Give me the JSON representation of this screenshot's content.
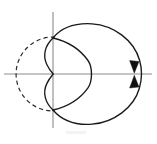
{
  "figure": {
    "background_color": "#ffffff",
    "width": 157,
    "height": 144,
    "origin": {
      "x": 53,
      "y": 74
    },
    "axes": {
      "axis_color": "#8c8c8c",
      "x_axis": {
        "name": "x-axis",
        "x1": 4,
        "y1": 74,
        "x2": 152,
        "y2": 74
      },
      "y_axis": {
        "name": "y-axis",
        "x1": 53,
        "y1": 12,
        "x2": 53,
        "y2": 128
      }
    },
    "curves": [
      {
        "name": "dashed-generating-circle",
        "style": "dashed",
        "color": "#2b2b2b",
        "center": {
          "x": 53,
          "y": 74
        },
        "radius": 37,
        "note": "dashed circle centered at origin, left arc visible"
      },
      {
        "name": "limacon-outer-loop",
        "style": "solid",
        "color": "#1a1a1a",
        "center": {
          "x": 90,
          "y": 74
        },
        "radius": 51,
        "note": "large solid circle passing near origin cusp"
      },
      {
        "name": "limacon-inner-loop",
        "style": "solid",
        "color": "#1a1a1a",
        "center": {
          "x": 72,
          "y": 74
        },
        "radius": 20,
        "note": "small inner loop through the origin forming a cusp"
      }
    ],
    "arrows": [
      {
        "name": "direction-arrow-upper",
        "x": 134,
        "y": 68,
        "direction": "down",
        "color": "#111111"
      },
      {
        "name": "direction-arrow-lower",
        "x": 134,
        "y": 80,
        "direction": "up",
        "color": "#111111"
      }
    ],
    "intersection_points": [
      {
        "name": "intersection-upper",
        "x": 53,
        "y": 38
      },
      {
        "name": "intersection-lower",
        "x": 53,
        "y": 110
      },
      {
        "name": "cusp-origin",
        "x": 53,
        "y": 74
      }
    ],
    "labels": []
  }
}
